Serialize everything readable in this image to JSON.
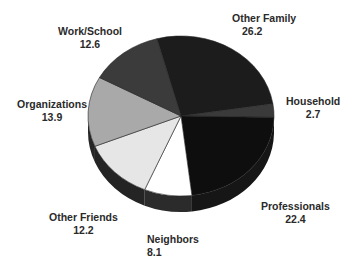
{
  "chart_data": {
    "type": "pie",
    "style": "3d",
    "title": "",
    "categories": [
      "Other Family",
      "Household",
      "Professionals",
      "Neighbors",
      "Other Friends",
      "Organizations",
      "Work/School"
    ],
    "values": [
      26.2,
      2.7,
      22.4,
      8.1,
      12.2,
      13.9,
      12.6
    ],
    "labels": [
      {
        "name": "Other Family",
        "value": "26.2"
      },
      {
        "name": "Household",
        "value": "2.7"
      },
      {
        "name": "Professionals",
        "value": "22.4"
      },
      {
        "name": "Neighbors",
        "value": "8.1"
      },
      {
        "name": "Other Friends",
        "value": "12.2"
      },
      {
        "name": "Organizations",
        "value": "13.9"
      },
      {
        "name": "Work/School",
        "value": "12.6"
      }
    ],
    "colors": [
      "#1c1c1c",
      "#3a3a3a",
      "#0e0e0e",
      "#ffffff",
      "#e6e6e6",
      "#a9a9a9",
      "#3b3b3b"
    ],
    "side_colors": [
      "#1a1a1a",
      "#2a2a2a",
      "#161616",
      "#2b2b2b",
      "#242424",
      "#262626",
      "#2a2a2a"
    ],
    "start_angle_deg": 345,
    "legend": "none"
  }
}
